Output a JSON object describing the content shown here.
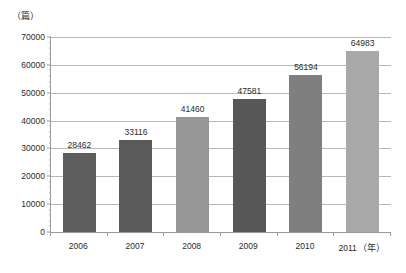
{
  "chart_data": {
    "type": "bar",
    "title": "",
    "subtitle": "",
    "xlabel": "",
    "ylabel": "",
    "y_unit_label": "（篇）",
    "x_unit_label": "（年）",
    "categories": [
      "2006",
      "2007",
      "2008",
      "2009",
      "2010",
      "2011"
    ],
    "values": [
      28462,
      33116,
      41460,
      47581,
      56194,
      64983
    ],
    "value_labels": [
      "28462",
      "33116",
      "41460",
      "47581",
      "56194",
      "64983"
    ],
    "bar_colors": [
      "#5e5e5e",
      "#5a5a5a",
      "#969696",
      "#575757",
      "#7f7f7f",
      "#a8a8a8"
    ],
    "ylim": [
      0,
      70000
    ],
    "ytick_values": [
      0,
      10000,
      20000,
      30000,
      40000,
      50000,
      60000,
      70000
    ],
    "ytick_labels": [
      "0",
      "10000",
      "20000",
      "30000",
      "40000",
      "50000",
      "60000",
      "70000"
    ],
    "yminor_step": 2000,
    "grid": "horizontal",
    "legend": "none",
    "legend_position": "",
    "annotations": [
      "Data labels shown above each bar"
    ]
  }
}
